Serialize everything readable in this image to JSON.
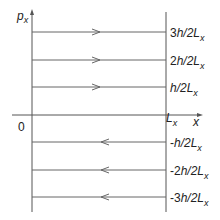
{
  "axes": {
    "y_label": "p",
    "y_label_sub": "x",
    "x_label": "x",
    "origin_label": "0",
    "right_boundary_label": "L",
    "right_boundary_sub": "x"
  },
  "levels": [
    {
      "label_coef": "3",
      "label_rest": "h/2L",
      "sub": "x",
      "direction": "right"
    },
    {
      "label_coef": "2",
      "label_rest": "h/2L",
      "sub": "x",
      "direction": "right"
    },
    {
      "label_coef": "",
      "label_rest": "h/2L",
      "sub": "x",
      "direction": "right"
    },
    {
      "label_coef": "-",
      "label_rest": "h/2L",
      "sub": "x",
      "direction": "left"
    },
    {
      "label_coef": "-2",
      "label_rest": "h/2L",
      "sub": "x",
      "direction": "left"
    },
    {
      "label_coef": "-3",
      "label_rest": "h/2L",
      "sub": "x",
      "direction": "left"
    }
  ],
  "colors": {
    "line": "#555555",
    "text": "#222222"
  }
}
